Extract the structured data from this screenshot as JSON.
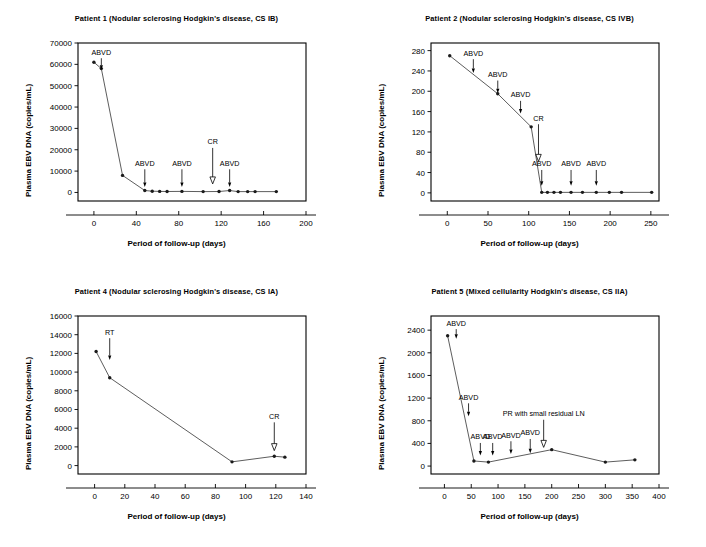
{
  "figure": {
    "background": "#ffffff",
    "line_color": "#333333",
    "marker_color": "#1a1a1a",
    "axis_color": "#000000"
  },
  "chart_data": [
    {
      "id": "patient-1",
      "type": "line",
      "title": "Patient 1 (Nodular sclerosing Hodgkin's disease, CS IB)",
      "xlabel": "Period of follow-up (days)",
      "ylabel": "Plasma EBV DNA (copies/mL)",
      "xlim": [
        -15,
        200
      ],
      "ylim": [
        -4000,
        70000
      ],
      "xticks": [
        0,
        40,
        80,
        120,
        160,
        200
      ],
      "xtick_labels": [
        "0",
        "40",
        "80",
        "120",
        "160",
        "200"
      ],
      "yticks": [
        0,
        10000,
        20000,
        30000,
        40000,
        50000,
        60000,
        70000
      ],
      "ytick_labels": [
        "0",
        "10000",
        "20000",
        "30000",
        "40000",
        "50000",
        "60000",
        "70000"
      ],
      "grid": false,
      "legend": "none",
      "x": [
        0,
        7,
        27,
        48,
        55,
        62,
        69,
        83,
        103,
        118,
        128,
        136,
        145,
        152,
        172
      ],
      "y": [
        61000,
        58000,
        8000,
        900,
        600,
        500,
        450,
        500,
        400,
        450,
        900,
        400,
        400,
        400,
        400
      ],
      "annotations": [
        {
          "label": "ABVD",
          "x": 7,
          "arrow": "filled",
          "text_y": 64500,
          "tip_y": 57500
        },
        {
          "label": "ABVD",
          "x": 48,
          "arrow": "filled",
          "text_y": 12500,
          "tip_y": 2500
        },
        {
          "label": "ABVD",
          "x": 83,
          "arrow": "filled",
          "text_y": 12500,
          "tip_y": 2500
        },
        {
          "label": "CR",
          "x": 112,
          "arrow": "open",
          "text_y": 22500,
          "tip_y": 4000
        },
        {
          "label": "ABVD",
          "x": 128,
          "arrow": "filled",
          "text_y": 12500,
          "tip_y": 2500
        }
      ]
    },
    {
      "id": "patient-2",
      "type": "line",
      "title": "Patient 2 (Nodular sclerosing Hodgkin's disease, CS IVB)",
      "xlabel": "Period of follow-up (days)",
      "ylabel": "Plasma EBV DNA (copies/mL)",
      "xlim": [
        -20,
        260
      ],
      "ylim": [
        -16,
        295
      ],
      "xticks": [
        0,
        50,
        100,
        150,
        200,
        250
      ],
      "xtick_labels": [
        "0",
        "50",
        "100",
        "150",
        "200",
        "250"
      ],
      "yticks": [
        0,
        40,
        80,
        120,
        160,
        200,
        240,
        280
      ],
      "ytick_labels": [
        "0",
        "40",
        "80",
        "120",
        "160",
        "200",
        "240",
        "280"
      ],
      "grid": false,
      "legend": "none",
      "x": [
        3,
        62,
        103,
        116,
        123,
        131,
        139,
        152,
        166,
        183,
        199,
        214,
        251
      ],
      "y": [
        270,
        195,
        130,
        1,
        1,
        1,
        1,
        1,
        1,
        1,
        1,
        1,
        1
      ],
      "annotations": [
        {
          "label": "ABVD",
          "x": 32,
          "arrow": "filled",
          "text_y": 270,
          "tip_y": 236
        },
        {
          "label": "ABVD",
          "x": 62,
          "arrow": "filled",
          "text_y": 228,
          "tip_y": 196
        },
        {
          "label": "ABVD",
          "x": 90,
          "arrow": "filled",
          "text_y": 188,
          "tip_y": 156
        },
        {
          "label": "CR",
          "x": 112,
          "arrow": "open",
          "text_y": 142,
          "tip_y": 62
        },
        {
          "label": "ABVD",
          "x": 116,
          "arrow": "filled",
          "text_y": 52,
          "tip_y": 14
        },
        {
          "label": "ABVD",
          "x": 152,
          "arrow": "filled",
          "text_y": 52,
          "tip_y": 14
        },
        {
          "label": "ABVD",
          "x": 183,
          "arrow": "filled",
          "text_y": 52,
          "tip_y": 14
        }
      ]
    },
    {
      "id": "patient-4",
      "type": "line",
      "title": "Patient 4 (Nodular sclerosing Hodgkin's disease, CS IA)",
      "xlabel": "Period of follow-up (days)",
      "ylabel": "Plasma EBV DNA (copies/mL)",
      "xlim": [
        -11,
        140
      ],
      "ylim": [
        -900,
        16000
      ],
      "xticks": [
        0,
        20,
        40,
        60,
        80,
        100,
        120,
        140
      ],
      "xtick_labels": [
        "0",
        "20",
        "40",
        "60",
        "80",
        "100",
        "120",
        "140"
      ],
      "yticks": [
        0,
        2000,
        4000,
        6000,
        8000,
        10000,
        12000,
        14000,
        16000
      ],
      "ytick_labels": [
        "0",
        "2000",
        "4000",
        "6000",
        "8000",
        "10000",
        "12000",
        "14000",
        "16000"
      ],
      "grid": false,
      "legend": "none",
      "x": [
        1,
        10,
        91,
        119,
        126
      ],
      "y": [
        12200,
        9400,
        400,
        1000,
        900
      ],
      "annotations": [
        {
          "label": "RT",
          "x": 10,
          "arrow": "filled",
          "text_y": 14000,
          "tip_y": 11300
        },
        {
          "label": "CR",
          "x": 119,
          "arrow": "open",
          "text_y": 5000,
          "tip_y": 1600
        }
      ]
    },
    {
      "id": "patient-5",
      "type": "line",
      "title": "Patient 5 (Mixed cellularity Hodgkin's disease, CS IIA)",
      "xlabel": "Period of follow-up (days)",
      "ylabel": "Plasma EBV DNA (copies/mL)",
      "xlim": [
        -25,
        400
      ],
      "ylim": [
        -140,
        2650
      ],
      "xticks": [
        0,
        50,
        100,
        150,
        200,
        250,
        300,
        350,
        400
      ],
      "xtick_labels": [
        "0",
        "50",
        "100",
        "150",
        "200",
        "250",
        "300",
        "350",
        "400"
      ],
      "yticks": [
        0,
        400,
        800,
        1200,
        1600,
        2000,
        2400
      ],
      "ytick_labels": [
        "0",
        "400",
        "800",
        "1200",
        "1600",
        "2000",
        "2400"
      ],
      "grid": false,
      "legend": "none",
      "x": [
        6,
        55,
        82,
        200,
        300,
        355
      ],
      "y": [
        2300,
        90,
        70,
        290,
        70,
        110
      ],
      "annotations": [
        {
          "label": "ABVD",
          "x": 22,
          "arrow": "filled",
          "text_y": 2480,
          "tip_y": 2250
        },
        {
          "label": "ABVD",
          "x": 45,
          "arrow": "filled",
          "text_y": 1170,
          "tip_y": 880
        },
        {
          "label": "ABVD",
          "x": 67,
          "arrow": "filled",
          "text_y": 470,
          "tip_y": 185
        },
        {
          "label": "ABVD",
          "x": 90,
          "arrow": "filled",
          "text_y": 470,
          "tip_y": 185
        },
        {
          "label": "ABVD",
          "x": 124,
          "arrow": "filled",
          "text_y": 500,
          "tip_y": 215
        },
        {
          "label": "ABVD",
          "x": 160,
          "arrow": "filled",
          "text_y": 540,
          "tip_y": 225
        },
        {
          "label": "PR with small residual LN",
          "x": 185,
          "arrow": "open",
          "text_y": 880,
          "tip_y": 330
        }
      ]
    }
  ]
}
